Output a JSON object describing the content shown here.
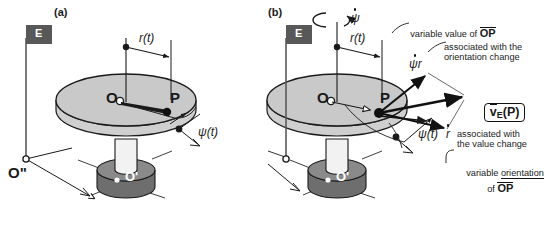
{
  "figure": {
    "type": "physics-kinematics-diagram",
    "background_color": "#ffffff",
    "line_color": "#1a1a1a",
    "disk_top_color": "#c9c9c9",
    "disk_edge_color": "#b0b0b0",
    "cylinder_color": "#6e6e6e",
    "flag_color": "#585858"
  },
  "panel_a": {
    "id": "(a)",
    "frame_flag_label": "E",
    "origin_label": "O",
    "point_label": "P",
    "ground_origin_label": "O\"",
    "base_origin_label": "O'",
    "radius_label": "r(t)",
    "angle_label": "ψ(t)"
  },
  "panel_b": {
    "id": "(b)",
    "spin_rate_label": "ψ",
    "spin_rate_has_dot": true,
    "origin_label": "O",
    "point_label": "P",
    "base_origin_label": "O'",
    "radius_label": "r(t)",
    "angle_label": "ψ(t)",
    "tangential_vector_label": "ψr",
    "radial_vector_label": "r",
    "velocity_box_label": "v",
    "velocity_box_sub": "E",
    "velocity_box_arg": "(P)",
    "callouts": {
      "variable_value": "variable value of ",
      "variable_value_vec": "OP",
      "orientation_change": "associated with the\norientation change",
      "value_change": "associated with\nthe value change",
      "variable_orientation_1": "variable ",
      "variable_orientation_underlined": "orientation",
      "variable_orientation_2": "of ",
      "variable_orientation_vec": "OP"
    }
  }
}
